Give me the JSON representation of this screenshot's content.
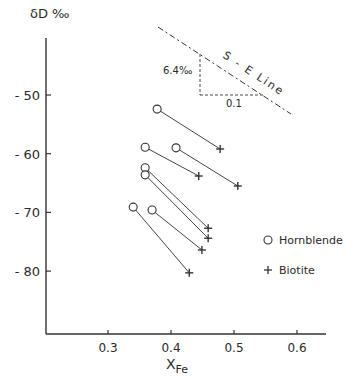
{
  "chart_data": {
    "type": "scatter",
    "title": "",
    "xlabel": "X",
    "xlabel_sub": "Fe",
    "ylabel": "δD ‰",
    "xlim": [
      0.2,
      0.65
    ],
    "ylim": [
      -90,
      -38
    ],
    "xticks": [
      0.3,
      0.4,
      0.5,
      0.6
    ],
    "xtick_labels": [
      "0.3",
      "0.4",
      "0.5",
      "0.6"
    ],
    "yticks": [
      -50,
      -60,
      -70,
      -80
    ],
    "ytick_labels": [
      "- 50",
      "- 60",
      "- 70",
      "- 80"
    ],
    "grid": false,
    "legend_position": "right",
    "series": [
      {
        "name": "Hornblende",
        "marker": "circle",
        "x": [
          0.378,
          0.408,
          0.359,
          0.359,
          0.359,
          0.34,
          0.37
        ],
        "y": [
          -52.4,
          -59.0,
          -58.9,
          -62.4,
          -63.6,
          -69.1,
          -69.6
        ]
      },
      {
        "name": "Biotite",
        "marker": "plus",
        "x": [
          0.478,
          0.506,
          0.444,
          0.459,
          0.459,
          0.449,
          0.429
        ],
        "y": [
          -59.2,
          -65.5,
          -63.8,
          -72.7,
          -74.4,
          -76.4,
          -80.3
        ]
      }
    ],
    "tie_lines": [
      {
        "from": [
          0.378,
          -52.4
        ],
        "to": [
          0.478,
          -59.2
        ]
      },
      {
        "from": [
          0.408,
          -59.0
        ],
        "to": [
          0.506,
          -65.5
        ]
      },
      {
        "from": [
          0.359,
          -58.9
        ],
        "to": [
          0.444,
          -63.8
        ]
      },
      {
        "from": [
          0.359,
          -62.4
        ],
        "to": [
          0.459,
          -72.7
        ]
      },
      {
        "from": [
          0.359,
          -63.6
        ],
        "to": [
          0.459,
          -74.4
        ]
      },
      {
        "from": [
          0.37,
          -69.6
        ],
        "to": [
          0.449,
          -76.4
        ]
      },
      {
        "from": [
          0.34,
          -69.1
        ],
        "to": [
          0.429,
          -80.3
        ]
      }
    ],
    "annotations": [
      {
        "text": "S - E  Line",
        "type": "dashed-reference-line"
      },
      {
        "text": "6.4‰",
        "type": "slope-rise"
      },
      {
        "text": "0.1",
        "type": "slope-run"
      }
    ]
  },
  "labels": {
    "ylabel": "δD ‰",
    "xlabel_main": "X",
    "xlabel_sub": "Fe",
    "se_line": "S - E  Line",
    "rise": "6.4‰",
    "run": "0.1",
    "legend_hornblende": "Hornblende",
    "legend_biotite": "Biotite"
  }
}
